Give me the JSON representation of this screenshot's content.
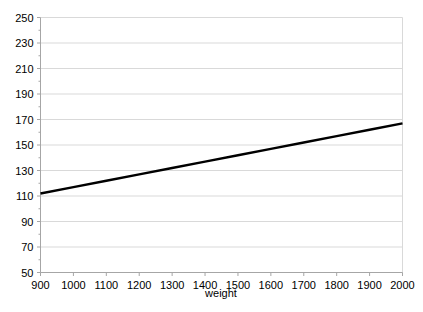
{
  "chart_data": {
    "type": "line",
    "title": "",
    "subtitle": "",
    "xlabel": "weight",
    "ylabel": "",
    "grid": "horizontal",
    "legend": "none",
    "xlim": [
      900,
      2000
    ],
    "ylim": [
      50,
      250
    ],
    "x_ticks": [
      900,
      1000,
      1100,
      1200,
      1300,
      1400,
      1500,
      1600,
      1700,
      1800,
      1900,
      2000
    ],
    "y_ticks": [
      50,
      70,
      90,
      110,
      130,
      150,
      170,
      190,
      210,
      230,
      250
    ],
    "x_tick_labels": [
      "900",
      "1000",
      "1100",
      "1200",
      "1300",
      "1400",
      "1500",
      "1600",
      "1700",
      "1800",
      "1900",
      "2000"
    ],
    "y_tick_labels": [
      "50",
      "70",
      "90",
      "110",
      "130",
      "150",
      "170",
      "190",
      "210",
      "230",
      "250"
    ],
    "series": [
      {
        "name": "fitted-line",
        "color": "#000000",
        "width": 2.4,
        "x": [
          900,
          1000,
          1100,
          1200,
          1300,
          1400,
          1500,
          1600,
          1700,
          1800,
          1900,
          2000
        ],
        "values": [
          112,
          117,
          122,
          127,
          132,
          137,
          142,
          147,
          152,
          157,
          162,
          167
        ]
      }
    ],
    "annotations": []
  },
  "style": {
    "background": "#ffffff",
    "grid_color": "#d9d9d9",
    "axis_color": "#a6a6a6",
    "tick_color": "#a6a6a6",
    "line_color": "#000000",
    "text_color": "#000000"
  },
  "axis_title": {
    "x": "weight"
  }
}
